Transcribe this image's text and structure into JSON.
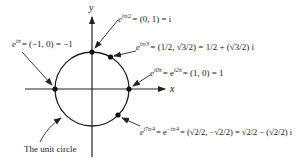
{
  "diagram": {
    "axes": {
      "x_label": "x",
      "y_label": "y"
    },
    "circle_label": "The unit circle",
    "points": [
      {
        "id": "top",
        "angle": "π/2",
        "label_lhs": "e",
        "label_exp": "iπ/2",
        "label_rhs": "= (0, 1) = i"
      },
      {
        "id": "pi3",
        "angle": "π/3",
        "label_lhs": "e",
        "label_exp": "iπ/3",
        "label_rhs": "= (1/2, √3/2) = 1/2 + (√3/2) i"
      },
      {
        "id": "left",
        "angle": "π",
        "label_lhs": "e",
        "label_exp": "iπ",
        "label_rhs": "= (−1, 0) = −1"
      },
      {
        "id": "right",
        "angle": "0",
        "label_lhs": "e",
        "label_exp": "i0π",
        "label_mid": "= e",
        "label_exp2": "i2π",
        "label_rhs": "= (1, 0) = 1"
      },
      {
        "id": "seven-pi4",
        "angle": "7π/4",
        "label_lhs": "e",
        "label_exp": "i7π/4",
        "label_mid": "= e",
        "label_exp2": "−iπ/4",
        "label_rhs": "= (√2/2, −√2/2) = √2/2 − (√2/2) i"
      }
    ]
  }
}
